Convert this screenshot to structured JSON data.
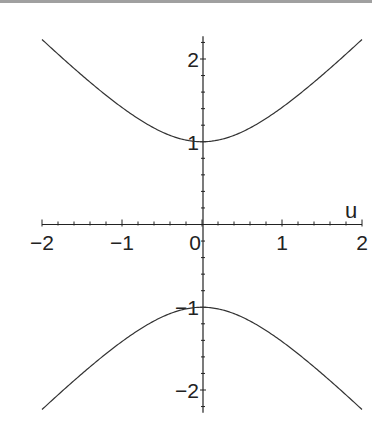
{
  "chart_data": {
    "type": "line",
    "title": "",
    "xlabel": "u",
    "ylabel": "",
    "xlim": [
      -2,
      2
    ],
    "ylim": [
      -2.3,
      2.3
    ],
    "grid": false,
    "legend": null,
    "x_ticks": [
      -2,
      -1,
      0,
      1,
      2
    ],
    "x_tick_labels": [
      "−2",
      "−1",
      "0",
      "1",
      "2"
    ],
    "y_ticks": [
      -2,
      -1,
      1,
      2
    ],
    "y_tick_labels": [
      "−2",
      "−1",
      "1",
      "2"
    ],
    "minor_tick_step": 0.2,
    "series": [
      {
        "name": "upper branch y = sqrt(1+u^2)",
        "x": [
          -2,
          -1.8,
          -1.6,
          -1.4,
          -1.2,
          -1,
          -0.8,
          -0.6,
          -0.4,
          -0.2,
          0,
          0.2,
          0.4,
          0.6,
          0.8,
          1,
          1.2,
          1.4,
          1.6,
          1.8,
          2
        ],
        "y": [
          2.236,
          2.059,
          1.887,
          1.72,
          1.562,
          1.414,
          1.281,
          1.166,
          1.077,
          1.02,
          1.0,
          1.02,
          1.077,
          1.166,
          1.281,
          1.414,
          1.562,
          1.72,
          1.887,
          2.059,
          2.236
        ]
      },
      {
        "name": "lower branch y = -sqrt(1+u^2)",
        "x": [
          -2,
          -1.8,
          -1.6,
          -1.4,
          -1.2,
          -1,
          -0.8,
          -0.6,
          -0.4,
          -0.2,
          0,
          0.2,
          0.4,
          0.6,
          0.8,
          1,
          1.2,
          1.4,
          1.6,
          1.8,
          2
        ],
        "y": [
          -2.236,
          -2.059,
          -1.887,
          -1.72,
          -1.562,
          -1.414,
          -1.281,
          -1.166,
          -1.077,
          -1.02,
          -1.0,
          -1.02,
          -1.077,
          -1.166,
          -1.281,
          -1.414,
          -1.562,
          -1.72,
          -1.887,
          -2.059,
          -2.236
        ]
      }
    ]
  },
  "style": {
    "line_color": "#333333",
    "axis_color": "#222222",
    "rule_color": "#a0a0a0"
  }
}
